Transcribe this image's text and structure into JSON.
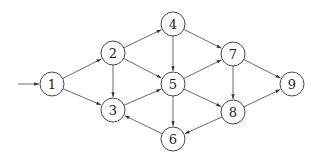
{
  "diagram": {
    "type": "directed-graph",
    "node_radius": 12,
    "colors": {
      "stroke": "#333333",
      "fill": "#ffffff",
      "text": "#222222"
    },
    "entry": {
      "from": [
        18,
        84
      ],
      "to": "1"
    },
    "nodes": [
      {
        "id": "1",
        "label": "1",
        "x": 52,
        "y": 84
      },
      {
        "id": "2",
        "label": "2",
        "x": 113,
        "y": 53
      },
      {
        "id": "3",
        "label": "3",
        "x": 113,
        "y": 110
      },
      {
        "id": "4",
        "label": "4",
        "x": 173,
        "y": 24
      },
      {
        "id": "5",
        "label": "5",
        "x": 173,
        "y": 84
      },
      {
        "id": "6",
        "label": "6",
        "x": 173,
        "y": 139
      },
      {
        "id": "7",
        "label": "7",
        "x": 233,
        "y": 54
      },
      {
        "id": "8",
        "label": "8",
        "x": 233,
        "y": 112
      },
      {
        "id": "9",
        "label": "9",
        "x": 292,
        "y": 84
      }
    ],
    "edges": [
      {
        "from": "1",
        "to": "2"
      },
      {
        "from": "1",
        "to": "3"
      },
      {
        "from": "2",
        "to": "3"
      },
      {
        "from": "2",
        "to": "4"
      },
      {
        "from": "2",
        "to": "5"
      },
      {
        "from": "3",
        "to": "5"
      },
      {
        "from": "4",
        "to": "5"
      },
      {
        "from": "4",
        "to": "7"
      },
      {
        "from": "5",
        "to": "7"
      },
      {
        "from": "5",
        "to": "8"
      },
      {
        "from": "5",
        "to": "6"
      },
      {
        "from": "6",
        "to": "3"
      },
      {
        "from": "7",
        "to": "8"
      },
      {
        "from": "7",
        "to": "9"
      },
      {
        "from": "8",
        "to": "9"
      },
      {
        "from": "8",
        "to": "6"
      }
    ]
  }
}
